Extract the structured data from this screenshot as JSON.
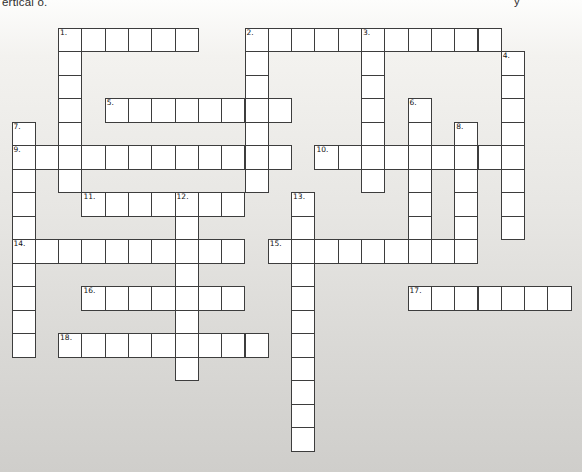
{
  "page": {
    "kind": "scanned crossword worksheet",
    "top_text_fragment_left": "ertical o.",
    "top_text_fragment_right": "y",
    "paper_gradient_top": "#fdfdfc",
    "paper_gradient_upper": "#f3f2ef",
    "paper_gradient_middle": "#e7e6e3",
    "paper_gradient_lower": "#d9d8d5",
    "paper_gradient_bottom": "#cfcecb"
  },
  "puzzle": {
    "grid": {
      "origin_x": 11.5,
      "origin_y": 27.5,
      "cell_width": 23.3,
      "cell_height": 23.5,
      "line_color": "#3d3d3d",
      "cell_fill": "#ffffff",
      "number_color": "#111111"
    },
    "words": [
      {
        "number": "1.",
        "direction": "across",
        "row": 0,
        "col": 2,
        "length": 6
      },
      {
        "number": "1.",
        "direction": "down",
        "row": 0,
        "col": 2,
        "length": 7
      },
      {
        "number": "2.",
        "direction": "across",
        "row": 0,
        "col": 10,
        "length": 11
      },
      {
        "number": "2.",
        "direction": "down",
        "row": 0,
        "col": 10,
        "length": 7
      },
      {
        "number": "3.",
        "direction": "down",
        "row": 0,
        "col": 15,
        "length": 7
      },
      {
        "number": "4.",
        "direction": "down",
        "row": 1,
        "col": 21,
        "length": 8
      },
      {
        "number": "5.",
        "direction": "across",
        "row": 3,
        "col": 4,
        "length": 8
      },
      {
        "number": "6.",
        "direction": "down",
        "row": 3,
        "col": 17,
        "length": 7
      },
      {
        "number": "7.",
        "direction": "down",
        "row": 4,
        "col": 0,
        "length": 10
      },
      {
        "number": "8.",
        "direction": "down",
        "row": 4,
        "col": 19,
        "length": 6
      },
      {
        "number": "9.",
        "direction": "across",
        "row": 5,
        "col": 0,
        "length": 12
      },
      {
        "number": "10.",
        "direction": "across",
        "row": 5,
        "col": 13,
        "length": 9
      },
      {
        "number": "11.",
        "direction": "across",
        "row": 7,
        "col": 3,
        "length": 7
      },
      {
        "number": "12.",
        "direction": "down",
        "row": 7,
        "col": 7,
        "length": 8
      },
      {
        "number": "13.",
        "direction": "down",
        "row": 7,
        "col": 12,
        "length": 11
      },
      {
        "number": "14.",
        "direction": "across",
        "row": 9,
        "col": 0,
        "length": 10
      },
      {
        "number": "15.",
        "direction": "across",
        "row": 9,
        "col": 11,
        "length": 9
      },
      {
        "number": "16.",
        "direction": "across",
        "row": 11,
        "col": 3,
        "length": 7
      },
      {
        "number": "17.",
        "direction": "across",
        "row": 11,
        "col": 17,
        "length": 7
      },
      {
        "number": "18.",
        "direction": "across",
        "row": 13,
        "col": 2,
        "length": 9
      }
    ]
  }
}
